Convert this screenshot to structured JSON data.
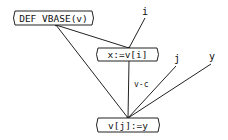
{
  "diagram": {
    "nodes": [
      {
        "id": "def",
        "label": "DEF VBASE(v)"
      },
      {
        "id": "xassign",
        "label": "x:=v[i]"
      },
      {
        "id": "vassign",
        "label": "v[j]:=y"
      }
    ],
    "inputs": [
      {
        "id": "i",
        "label": "i"
      },
      {
        "id": "j",
        "label": "j"
      },
      {
        "id": "y",
        "label": "y"
      }
    ],
    "edges": [
      {
        "from": "def",
        "to": "xassign",
        "label": ""
      },
      {
        "from": "def",
        "to": "vassign",
        "label": ""
      },
      {
        "from": "i",
        "to": "xassign",
        "label": ""
      },
      {
        "from": "xassign",
        "to": "vassign",
        "label": "v-c"
      },
      {
        "from": "j",
        "to": "vassign",
        "label": ""
      },
      {
        "from": "y",
        "to": "vassign",
        "label": ""
      }
    ]
  }
}
